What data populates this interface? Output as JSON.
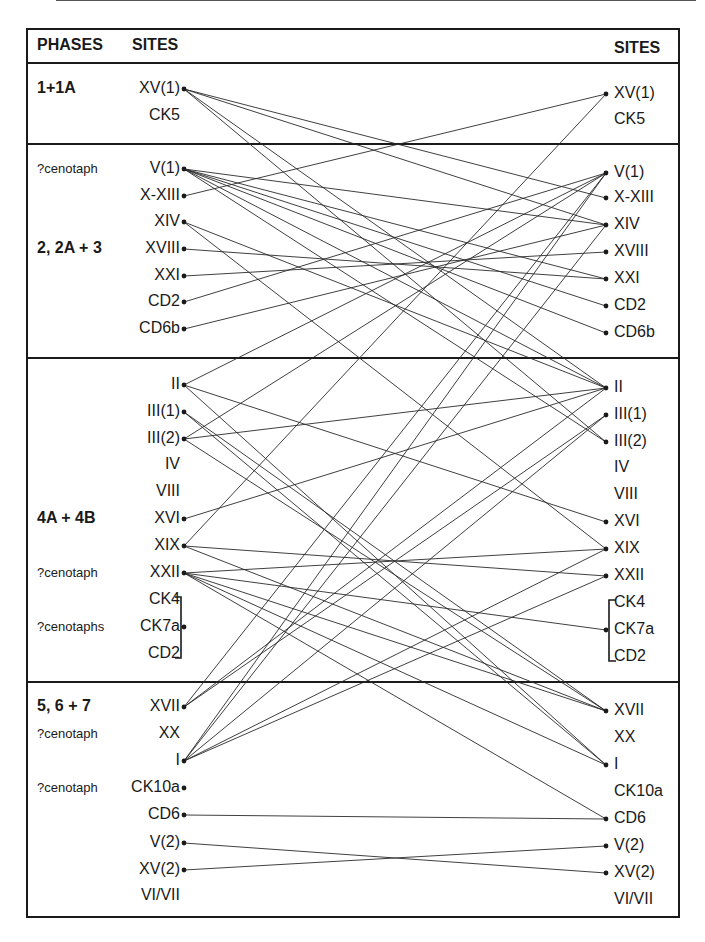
{
  "header": {
    "phases": "PHASES",
    "sites_left": "SITES",
    "sites_right": "SITES"
  },
  "phases": [
    {
      "label": "1+1A",
      "y": 89
    },
    {
      "label": "2, 2A + 3",
      "y": 249
    },
    {
      "label": "4A + 4B",
      "y": 519
    },
    {
      "label": "5, 6 + 7",
      "y": 707
    }
  ],
  "notes": [
    {
      "label": "?cenotaph",
      "y": 169
    },
    {
      "label": "?cenotaph",
      "y": 573
    },
    {
      "label": "?cenotaphs",
      "y": 627
    },
    {
      "label": "?cenotaph",
      "y": 734
    },
    {
      "label": "?cenotaph",
      "y": 788
    }
  ],
  "dividers": [
    62,
    143,
    357,
    681
  ],
  "left_sites": [
    {
      "id": "XV1",
      "label": "XV(1)",
      "y": 89,
      "dot": true
    },
    {
      "id": "CK5",
      "label": "CK5",
      "y": 116,
      "dot": false
    },
    {
      "id": "V1",
      "label": "V(1)",
      "y": 169,
      "dot": true
    },
    {
      "id": "XXIII",
      "label": "X-XIII",
      "y": 196,
      "dot": true
    },
    {
      "id": "XIV",
      "label": "XIV",
      "y": 222,
      "dot": true
    },
    {
      "id": "XVIII",
      "label": "XVIII",
      "y": 249,
      "dot": true
    },
    {
      "id": "XXI",
      "label": "XXI",
      "y": 276,
      "dot": true
    },
    {
      "id": "CD2a",
      "label": "CD2",
      "y": 302,
      "dot": true
    },
    {
      "id": "CD6b",
      "label": "CD6b",
      "y": 329,
      "dot": true
    },
    {
      "id": "II",
      "label": "II",
      "y": 385,
      "dot": true
    },
    {
      "id": "III1",
      "label": "III(1)",
      "y": 412,
      "dot": true
    },
    {
      "id": "III2",
      "label": "III(2)",
      "y": 439,
      "dot": true
    },
    {
      "id": "IV",
      "label": "IV",
      "y": 465,
      "dot": false
    },
    {
      "id": "VIII",
      "label": "VIII",
      "y": 492,
      "dot": false
    },
    {
      "id": "XVI",
      "label": "XVI",
      "y": 519,
      "dot": true
    },
    {
      "id": "XIX",
      "label": "XIX",
      "y": 546,
      "dot": true
    },
    {
      "id": "XXII",
      "label": "XXII",
      "y": 573,
      "dot": true
    },
    {
      "id": "CK4",
      "label": "CK4",
      "y": 600,
      "dot": false
    },
    {
      "id": "CK7a",
      "label": "CK7a",
      "y": 627,
      "dot": true
    },
    {
      "id": "CD2b",
      "label": "CD2",
      "y": 654,
      "dot": false
    },
    {
      "id": "XVII",
      "label": "XVII",
      "y": 707,
      "dot": true
    },
    {
      "id": "XX",
      "label": "XX",
      "y": 734,
      "dot": false
    },
    {
      "id": "I",
      "label": "I",
      "y": 761,
      "dot": true
    },
    {
      "id": "CK10a",
      "label": "CK10a",
      "y": 788,
      "dot": true
    },
    {
      "id": "CD6",
      "label": "CD6",
      "y": 815,
      "dot": true
    },
    {
      "id": "V2",
      "label": "V(2)",
      "y": 843,
      "dot": true
    },
    {
      "id": "XV2",
      "label": "XV(2)",
      "y": 870,
      "dot": true
    },
    {
      "id": "VIVII",
      "label": "VI/VII",
      "y": 896,
      "dot": false
    }
  ],
  "right_sites": [
    {
      "id": "XV1",
      "label": "XV(1)",
      "y": 94,
      "dot": true
    },
    {
      "id": "CK5",
      "label": "CK5",
      "y": 120,
      "dot": false
    },
    {
      "id": "V1",
      "label": "V(1)",
      "y": 173,
      "dot": true
    },
    {
      "id": "XXIII",
      "label": "X-XIII",
      "y": 198,
      "dot": true
    },
    {
      "id": "XIV",
      "label": "XIV",
      "y": 225,
      "dot": true
    },
    {
      "id": "XVIII",
      "label": "XVIII",
      "y": 252,
      "dot": true
    },
    {
      "id": "XXI",
      "label": "XXI",
      "y": 279,
      "dot": true
    },
    {
      "id": "CD2a",
      "label": "CD2",
      "y": 306,
      "dot": true
    },
    {
      "id": "CD6b",
      "label": "CD6b",
      "y": 333,
      "dot": true
    },
    {
      "id": "II",
      "label": "II",
      "y": 388,
      "dot": true
    },
    {
      "id": "III1",
      "label": "III(1)",
      "y": 415,
      "dot": true
    },
    {
      "id": "III2",
      "label": "III(2)",
      "y": 442,
      "dot": true
    },
    {
      "id": "IV",
      "label": "IV",
      "y": 468,
      "dot": false
    },
    {
      "id": "VIII",
      "label": "VIII",
      "y": 495,
      "dot": false
    },
    {
      "id": "XVI",
      "label": "XVI",
      "y": 522,
      "dot": true
    },
    {
      "id": "XIX",
      "label": "XIX",
      "y": 549,
      "dot": true
    },
    {
      "id": "XXII",
      "label": "XXII",
      "y": 576,
      "dot": true
    },
    {
      "id": "CK4",
      "label": "CK4",
      "y": 603,
      "dot": false
    },
    {
      "id": "CK7a",
      "label": "CK7a",
      "y": 630,
      "dot": true
    },
    {
      "id": "CD2b",
      "label": "CD2",
      "y": 657,
      "dot": false
    },
    {
      "id": "XVII",
      "label": "XVII",
      "y": 711,
      "dot": true
    },
    {
      "id": "XX",
      "label": "XX",
      "y": 738,
      "dot": false
    },
    {
      "id": "I",
      "label": "I",
      "y": 765,
      "dot": true
    },
    {
      "id": "CK10a",
      "label": "CK10a",
      "y": 792,
      "dot": false
    },
    {
      "id": "CD6",
      "label": "CD6",
      "y": 819,
      "dot": true
    },
    {
      "id": "V2",
      "label": "V(2)",
      "y": 846,
      "dot": true
    },
    {
      "id": "XV2",
      "label": "XV(2)",
      "y": 873,
      "dot": true
    },
    {
      "id": "VIVII",
      "label": "VI/VII",
      "y": 900,
      "dot": false
    }
  ],
  "edges": [
    [
      "XV1",
      "XXIII"
    ],
    [
      "XV1",
      "XIV"
    ],
    [
      "XV1",
      "II"
    ],
    [
      "XV1",
      "III2"
    ],
    [
      "XXIII",
      "XV1"
    ],
    [
      "V1",
      "XIV"
    ],
    [
      "V1",
      "CD2a"
    ],
    [
      "V1",
      "CD6b"
    ],
    [
      "V1",
      "III2"
    ],
    [
      "V1",
      "II"
    ],
    [
      "V1",
      "XXI"
    ],
    [
      "XIV",
      "XIX"
    ],
    [
      "XIV",
      "II"
    ],
    [
      "XVIII",
      "XXI"
    ],
    [
      "XXI",
      "XVIII"
    ],
    [
      "CD2a",
      "V1"
    ],
    [
      "CD6b",
      "XIV"
    ],
    [
      "II",
      "V1"
    ],
    [
      "II",
      "XVI"
    ],
    [
      "II",
      "I"
    ],
    [
      "III1",
      "XVII"
    ],
    [
      "III1",
      "I"
    ],
    [
      "III2",
      "II"
    ],
    [
      "III2",
      "XVII"
    ],
    [
      "III2",
      "V1"
    ],
    [
      "XVI",
      "II"
    ],
    [
      "XIX",
      "XV1"
    ],
    [
      "XIX",
      "XXII"
    ],
    [
      "XIX",
      "XVII"
    ],
    [
      "XXII",
      "XIX"
    ],
    [
      "XXII",
      "CK7a"
    ],
    [
      "XXII",
      "I"
    ],
    [
      "XXII",
      "XVII"
    ],
    [
      "XVII",
      "V1"
    ],
    [
      "XVII",
      "III1"
    ],
    [
      "XVII",
      "II"
    ],
    [
      "I",
      "III1"
    ],
    [
      "I",
      "XIX"
    ],
    [
      "I",
      "XXII"
    ],
    [
      "I",
      "XIV"
    ],
    [
      "I",
      "V1"
    ],
    [
      "CD6",
      "CD6"
    ],
    [
      "V2",
      "XV2"
    ],
    [
      "XV2",
      "V2"
    ],
    [
      "XXII",
      "CD6"
    ]
  ],
  "colors": {
    "ink": "#1a1a1a",
    "line": "#2a2a2a"
  },
  "geometry": {
    "left_dot_x": 184,
    "right_dot_x": 606
  }
}
